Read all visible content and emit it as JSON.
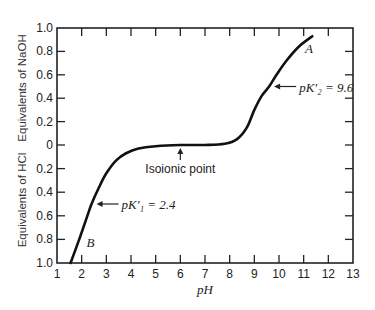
{
  "chart_data": {
    "type": "line",
    "title": "",
    "xlabel": "pH",
    "ylabel_top": "Equivalents of NaOH",
    "ylabel_bottom": "Equivalents of HCl",
    "xlim": [
      1,
      13
    ],
    "ylim": [
      -1.0,
      1.0
    ],
    "y_sign_note": "positive = equivalents of NaOH, negative = equivalents of HCl",
    "x_ticks": [
      "1",
      "2",
      "3",
      "4",
      "5",
      "6",
      "7",
      "8",
      "9",
      "10",
      "11",
      "12",
      "13"
    ],
    "y_ticks_top": [
      "1.0",
      "0.8",
      "0.6",
      "0.4",
      "0.2",
      "0"
    ],
    "y_ticks_bottom": [
      "0.2",
      "0.4",
      "0.6",
      "0.8",
      "1.0"
    ],
    "grid": false,
    "series": [
      {
        "name": "titration curve",
        "x": [
          1.55,
          1.9,
          2.2,
          2.4,
          2.7,
          3.0,
          3.4,
          3.8,
          4.3,
          5.0,
          6.0,
          7.0,
          7.8,
          8.3,
          8.7,
          9.0,
          9.3,
          9.6,
          9.9,
          10.3,
          10.8,
          11.35
        ],
        "y": [
          -1.0,
          -0.8,
          -0.62,
          -0.5,
          -0.36,
          -0.24,
          -0.13,
          -0.07,
          -0.03,
          -0.01,
          0.0,
          0.0,
          0.01,
          0.05,
          0.15,
          0.3,
          0.42,
          0.5,
          0.6,
          0.72,
          0.84,
          0.93
        ]
      }
    ],
    "annotations": [
      {
        "id": "label-A",
        "text": "A",
        "x": 11.05,
        "y": 0.83
      },
      {
        "id": "label-B",
        "text": "B",
        "x": 2.2,
        "y": -0.82
      },
      {
        "id": "pk1",
        "text": "pK′₁ = 2.4",
        "x": 2.4,
        "y": -0.5,
        "arrow": "left"
      },
      {
        "id": "pk2",
        "text": "pK′₂ = 9.6",
        "x": 9.6,
        "y": 0.5,
        "arrow": "left"
      },
      {
        "id": "isoionic",
        "text": "Isoionic point",
        "x": 6.0,
        "y": 0.0,
        "arrow": "up"
      }
    ]
  }
}
